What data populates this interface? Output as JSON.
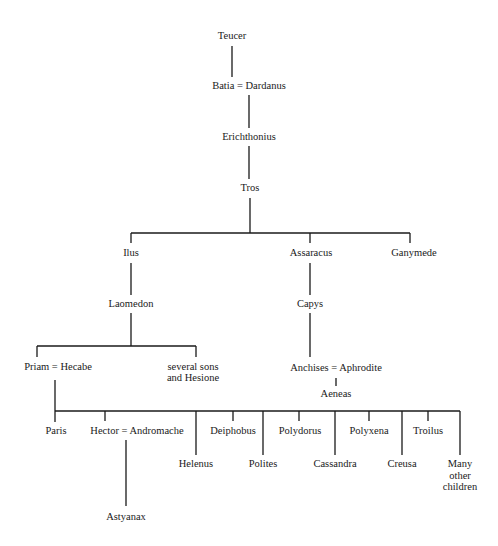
{
  "diagram": {
    "type": "family-tree",
    "line_color": "#1a1a1a",
    "nodes": {
      "teucer": "Teucer",
      "batia_dardanus": "Batia = Dardanus",
      "erichthonius": "Erichthonius",
      "tros": "Tros",
      "ilus": "Ilus",
      "assaracus": "Assaracus",
      "ganymede": "Ganymede",
      "laomedon": "Laomedon",
      "capys": "Capys",
      "priam_hecabe": "Priam = Hecabe",
      "several_sons_1": "several sons",
      "several_sons_2": "and Hesione",
      "anchises_aphrodite": "Anchises = Aphrodite",
      "aeneas": "Aeneas",
      "paris": "Paris",
      "hector_andromache": "Hector  = Andromache",
      "helenus": "Helenus",
      "deiphobus": "Deiphobus",
      "polites": "Polites",
      "polydorus": "Polydorus",
      "cassandra": "Cassandra",
      "polyxena": "Polyxena",
      "creusa": "Creusa",
      "troilus": "Troilus",
      "many_1": "Many",
      "many_2": "other",
      "many_3": "children",
      "astyanax": "Astyanax"
    },
    "edges": [
      [
        "Teucer",
        "Batia = Dardanus"
      ],
      [
        "Batia = Dardanus",
        "Erichthonius"
      ],
      [
        "Erichthonius",
        "Tros"
      ],
      [
        "Tros",
        "Ilus"
      ],
      [
        "Tros",
        "Assaracus"
      ],
      [
        "Tros",
        "Ganymede"
      ],
      [
        "Ilus",
        "Laomedon"
      ],
      [
        "Laomedon",
        "Priam = Hecabe"
      ],
      [
        "Laomedon",
        "several sons and Hesione"
      ],
      [
        "Assaracus",
        "Capys"
      ],
      [
        "Capys",
        "Anchises = Aphrodite"
      ],
      [
        "Anchises = Aphrodite",
        "Aeneas"
      ],
      [
        "Priam = Hecabe",
        "Paris"
      ],
      [
        "Priam = Hecabe",
        "Hector"
      ],
      [
        "Priam = Hecabe",
        "Helenus"
      ],
      [
        "Priam = Hecabe",
        "Deiphobus"
      ],
      [
        "Priam = Hecabe",
        "Polites"
      ],
      [
        "Priam = Hecabe",
        "Polydorus"
      ],
      [
        "Priam = Hecabe",
        "Cassandra"
      ],
      [
        "Priam = Hecabe",
        "Polyxena"
      ],
      [
        "Priam = Hecabe",
        "Creusa"
      ],
      [
        "Priam = Hecabe",
        "Troilus"
      ],
      [
        "Priam = Hecabe",
        "Many other children"
      ],
      [
        "Hector = Andromache",
        "Astyanax"
      ]
    ]
  }
}
